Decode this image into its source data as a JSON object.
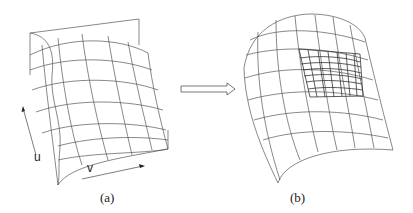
{
  "figure": {
    "panel_a": {
      "caption": "(a)",
      "axis_u_label": "u",
      "axis_v_label": "v",
      "description": "Coarse wireframe bicubic surface patch with parametric directions u and v"
    },
    "transition_arrow": "hollow-right-arrow",
    "panel_b": {
      "caption": "(b)",
      "description": "Curved wireframe surface with a locally refined dense sub-grid region"
    }
  }
}
